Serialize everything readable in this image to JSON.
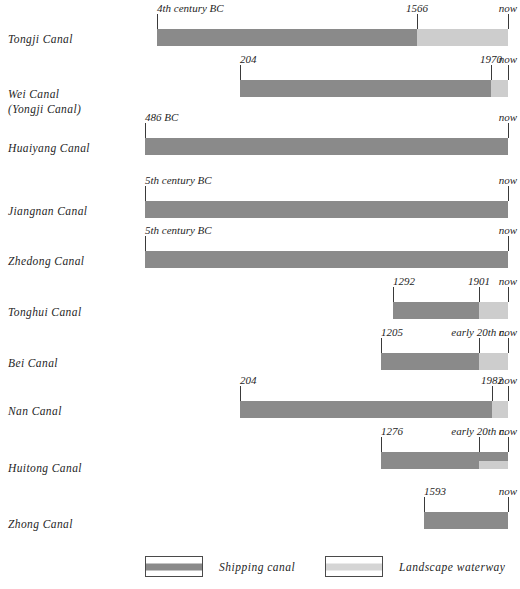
{
  "chart_data": {
    "type": "bar",
    "title": "",
    "subtitle": "",
    "xlabel": "",
    "ylabel": "",
    "legend_position": "bottom",
    "grid": false,
    "orientation": "horizontal-timeline",
    "axis_note": "non-linear time axis; bar ends at 'now' on right edge",
    "categories": [
      "Tongji Canal",
      "Wei Canal (Yongji Canal)",
      "Huaiyang Canal",
      "Jiangnan Canal",
      "Zhedong Canal",
      "Tonghui Canal",
      "Bei Canal",
      "Nan Canal",
      "Huitong Canal",
      "Zhong Canal"
    ],
    "series": [
      {
        "name": "Shipping canal",
        "color": "#8a8a8a"
      },
      {
        "name": "Landscape waterway",
        "color": "#cdcdcd"
      }
    ],
    "rows": [
      {
        "name": "Tongji Canal",
        "label": "Tongji Canal",
        "label_sub": "",
        "start_label": "4th century BC",
        "end_label": "now",
        "split_label": "1566",
        "shipping_span": [
          "4th century BC",
          "1566"
        ],
        "landscape_span": [
          "1566",
          "now"
        ],
        "px": {
          "start": 157,
          "split": 417,
          "end": 508
        },
        "split_style": "full"
      },
      {
        "name": "Wei Canal",
        "label": "Wei  Canal",
        "label_sub": "(Yongji  Canal)",
        "start_label": "204",
        "end_label": "now",
        "split_label": "1970",
        "shipping_span": [
          "204",
          "1970"
        ],
        "landscape_span": [
          "1970",
          "now"
        ],
        "px": {
          "start": 240,
          "split": 491,
          "end": 508
        },
        "split_style": "full"
      },
      {
        "name": "Huaiyang Canal",
        "label": "Huaiyang  Canal",
        "label_sub": "",
        "start_label": "486 BC",
        "end_label": "now",
        "split_label": "",
        "shipping_span": [
          "486 BC",
          "now"
        ],
        "landscape_span": null,
        "px": {
          "start": 145,
          "split": 508,
          "end": 508
        },
        "split_style": "full"
      },
      {
        "name": "Jiangnan Canal",
        "label": "Jiangnan  Canal",
        "label_sub": "",
        "start_label": "5th century BC",
        "end_label": "now",
        "split_label": "",
        "shipping_span": [
          "5th century BC",
          "now"
        ],
        "landscape_span": null,
        "px": {
          "start": 145,
          "split": 508,
          "end": 508
        },
        "split_style": "full"
      },
      {
        "name": "Zhedong Canal",
        "label": "Zhedong  Canal",
        "label_sub": "",
        "start_label": "5th century BC",
        "end_label": "now",
        "split_label": "",
        "shipping_span": [
          "5th century BC",
          "now"
        ],
        "landscape_span": null,
        "px": {
          "start": 145,
          "split": 508,
          "end": 508
        },
        "split_style": "full"
      },
      {
        "name": "Tonghui Canal",
        "label": "Tonghui  Canal",
        "label_sub": "",
        "start_label": "1292",
        "end_label": "now",
        "split_label": "1901",
        "shipping_span": [
          "1292",
          "1901"
        ],
        "landscape_span": [
          "1901",
          "now"
        ],
        "px": {
          "start": 393,
          "split": 479,
          "end": 508
        },
        "split_style": "full"
      },
      {
        "name": "Bei Canal",
        "label": "Bei  Canal",
        "label_sub": "",
        "start_label": "1205",
        "end_label": "now",
        "split_label": "early 20th c.",
        "shipping_span": [
          "1205",
          "early 20th c."
        ],
        "landscape_span": [
          "early 20th c.",
          "now"
        ],
        "px": {
          "start": 381,
          "split": 479,
          "end": 508
        },
        "split_style": "full"
      },
      {
        "name": "Nan Canal",
        "label": "Nan  Canal",
        "label_sub": "",
        "start_label": "204",
        "end_label": "now",
        "split_label": "1982",
        "shipping_span": [
          "204",
          "1982"
        ],
        "landscape_span": [
          "1982",
          "now"
        ],
        "px": {
          "start": 240,
          "split": 492,
          "end": 508
        },
        "split_style": "full"
      },
      {
        "name": "Huitong Canal",
        "label": "Huitong  Canal",
        "label_sub": "",
        "start_label": "1276",
        "end_label": "now",
        "split_label": "early 20th c.",
        "shipping_span": [
          "1276",
          "now"
        ],
        "landscape_span": [
          "early 20th c.",
          "now"
        ],
        "px": {
          "start": 381,
          "split": 479,
          "end": 508
        },
        "split_style": "half-bottom"
      },
      {
        "name": "Zhong Canal",
        "label": "Zhong  Canal",
        "label_sub": "",
        "start_label": "1593",
        "end_label": "now",
        "split_label": "",
        "shipping_span": [
          "1593",
          "now"
        ],
        "landscape_span": null,
        "px": {
          "start": 424,
          "split": 508,
          "end": 508
        },
        "split_style": "full"
      }
    ]
  },
  "colors": {
    "shipping": "#8a8a8a",
    "landscape": "#cdcdcd",
    "tick": "#3a3a3a",
    "text": "#1f1f1f",
    "background": "#ffffff"
  },
  "legend": {
    "items": [
      {
        "label": "Shipping   canal",
        "color": "#8a8a8a",
        "left": 145
      },
      {
        "label": "Landscape waterway",
        "color": "#d5d5d5",
        "left": 325
      }
    ],
    "top": 556
  },
  "layout": {
    "rows_geometry": [
      {
        "bar_top": 29,
        "label_top": 33,
        "tick_top": 14,
        "tick_h": 15,
        "date_top": 2
      },
      {
        "bar_top": 80,
        "label_top": 88,
        "tick_top": 65,
        "tick_h": 15,
        "date_top": 53
      },
      {
        "bar_top": 138,
        "label_top": 142,
        "tick_top": 123,
        "tick_h": 15,
        "date_top": 111
      },
      {
        "bar_top": 201,
        "label_top": 205,
        "tick_top": 186,
        "tick_h": 15,
        "date_top": 174
      },
      {
        "bar_top": 251,
        "label_top": 255,
        "tick_top": 236,
        "tick_h": 15,
        "date_top": 224
      },
      {
        "bar_top": 302,
        "label_top": 306,
        "tick_top": 287,
        "tick_h": 15,
        "date_top": 275
      },
      {
        "bar_top": 353,
        "label_top": 357,
        "tick_top": 338,
        "tick_h": 15,
        "date_top": 326
      },
      {
        "bar_top": 401,
        "label_top": 405,
        "tick_top": 386,
        "tick_h": 15,
        "date_top": 374
      },
      {
        "bar_top": 452,
        "label_top": 462,
        "tick_top": 437,
        "tick_h": 15,
        "date_top": 425
      },
      {
        "bar_top": 512,
        "label_top": 518,
        "tick_top": 497,
        "tick_h": 15,
        "date_top": 485
      }
    ]
  }
}
